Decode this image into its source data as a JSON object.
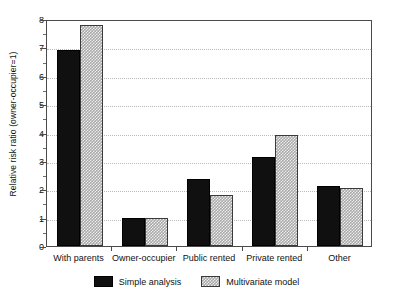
{
  "chart_data": {
    "type": "bar",
    "title": "",
    "subtitle": "",
    "xlabel": "",
    "ylabel": "Relative risk ratio (owner-occupier=1)",
    "categories": [
      "With parents",
      "Owner-occupier",
      "Public rented",
      "Private rented",
      "Other"
    ],
    "series": [
      {
        "name": "Simple analysis",
        "color": "#101010",
        "pattern": "solid-black",
        "values": [
          6.9,
          1.0,
          2.35,
          3.15,
          2.1
        ]
      },
      {
        "name": "Multivariate model",
        "color": "#a8a8a8",
        "pattern": "gray-checkerboard",
        "values": [
          7.8,
          1.0,
          1.8,
          3.9,
          2.05
        ]
      }
    ],
    "ylim": [
      0,
      8
    ],
    "ytick_labels": [
      "0",
      "1",
      "2",
      "3",
      "4",
      "5",
      "6",
      "7",
      "8"
    ],
    "ytick_values": [
      0,
      1,
      2,
      3,
      4,
      5,
      6,
      7,
      8
    ],
    "yminor_values": [
      0.5,
      1.5,
      2.5,
      3.5,
      4.5,
      5.5,
      6.5,
      7.5
    ],
    "grid": true,
    "grid_axis": "y",
    "grid_style": "dotted",
    "grid_color": "#b9b9b9",
    "legend_position": "bottom-center",
    "frame": true,
    "frame_color": "#4a4a4a",
    "background": "#ffffff"
  },
  "legend": {
    "items": [
      {
        "label": "Simple analysis",
        "swatch": "solid-black-swatch"
      },
      {
        "label": "Multivariate model",
        "swatch": "gray-checkerboard-swatch"
      }
    ]
  }
}
